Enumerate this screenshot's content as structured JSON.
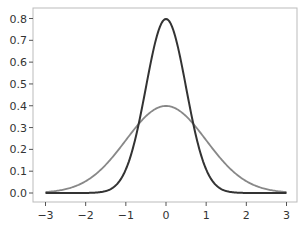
{
  "chart_data": {
    "type": "line",
    "title": "",
    "xlabel": "",
    "ylabel": "",
    "xlim": [
      -3.2,
      3.2
    ],
    "ylim": [
      -0.04,
      0.84
    ],
    "grid": false,
    "legend": null,
    "x_ticks": [
      -3,
      -2,
      -1,
      0,
      1,
      2,
      3
    ],
    "x_tick_labels": [
      "−3",
      "−2",
      "−1",
      "0",
      "1",
      "2",
      "3"
    ],
    "y_ticks": [
      0.0,
      0.1,
      0.2,
      0.3,
      0.4,
      0.5,
      0.6,
      0.7,
      0.8
    ],
    "y_tick_labels": [
      "0.0",
      "0.1",
      "0.2",
      "0.3",
      "0.4",
      "0.5",
      "0.6",
      "0.7",
      "0.8"
    ],
    "series": [
      {
        "name": "Normal PDF (mean 0, sd 0.5)",
        "color": "#333333",
        "mean": 0,
        "sd": 0.5,
        "x": [
          -3,
          -2.5,
          -2,
          -1.5,
          -1.25,
          -1,
          -0.75,
          -0.5,
          -0.25,
          0,
          0.25,
          0.5,
          0.75,
          1,
          1.25,
          1.5,
          2,
          2.5,
          3
        ],
        "values": [
          0.0,
          0.0,
          0.0003,
          0.0089,
          0.035,
          0.108,
          0.259,
          0.484,
          0.704,
          0.798,
          0.704,
          0.484,
          0.259,
          0.108,
          0.035,
          0.0089,
          0.0003,
          0.0,
          0.0
        ]
      },
      {
        "name": "Normal PDF (mean 0, sd 1)",
        "color": "#888888",
        "mean": 0,
        "sd": 1,
        "x": [
          -3,
          -2.5,
          -2,
          -1.5,
          -1.25,
          -1,
          -0.75,
          -0.5,
          -0.25,
          0,
          0.25,
          0.5,
          0.75,
          1,
          1.25,
          1.5,
          2,
          2.5,
          3
        ],
        "values": [
          0.0044,
          0.0175,
          0.054,
          0.1295,
          0.1826,
          0.242,
          0.3011,
          0.3521,
          0.3867,
          0.3989,
          0.3867,
          0.3521,
          0.3011,
          0.242,
          0.1826,
          0.1295,
          0.054,
          0.0175,
          0.0044
        ]
      }
    ]
  }
}
